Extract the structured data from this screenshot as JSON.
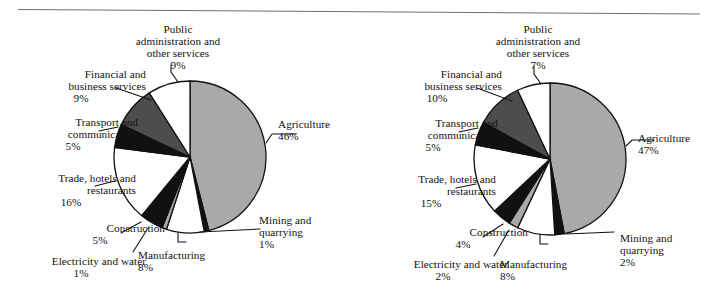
{
  "figure": {
    "name": "sectoral-composition-pies",
    "panel_count": 2,
    "divider": "top-horizontal-rule"
  },
  "colors": {
    "agriculture": "#a9a9a9",
    "mining": "#111111",
    "manufacturing": "#ffffff",
    "electricity": "#a9a9a9",
    "construction": "#111111",
    "trade": "#ffffff",
    "transport": "#111111",
    "financial": "#4d4d4d",
    "public_admin": "#ffffff",
    "outline": "#111111",
    "text": "#111111",
    "rule": "#6f6f6f",
    "background": "#ffffff"
  },
  "chart_data": [
    {
      "type": "pie",
      "name": "left-pie",
      "title": "",
      "legend_position": "callout-labels",
      "start_angle_deg": 0,
      "direction": "clockwise",
      "center": {
        "x": 190,
        "y": 157
      },
      "radius": 76,
      "categories": [
        "Agriculture",
        "Mining and quarrying",
        "Manufacturing",
        "Electricity and water",
        "Construction",
        "Trade, hotels and restaurants",
        "Transport and communication",
        "Financial and business services",
        "Public administration and other services"
      ],
      "values": [
        46,
        1,
        8,
        1,
        5,
        16,
        5,
        9,
        9
      ],
      "value_labels": [
        "46%",
        "1%",
        "8%",
        "1%",
        "5%",
        "16%",
        "5%",
        "9%",
        "9%"
      ],
      "slices": [
        {
          "label": "Agriculture",
          "pct": 46,
          "pct_text": "46%",
          "fill": "#a9a9a9",
          "label_lines": [
            "Agriculture"
          ],
          "label_x": 278,
          "label_y": 118,
          "align": "left",
          "leader": "M 266,143 L 272,134 L 296,134"
        },
        {
          "label": "Mining and quarrying",
          "pct": 1,
          "pct_text": "1%",
          "fill": "#111111",
          "label_lines": [
            "Mining and",
            "quarrying"
          ],
          "label_x": 259,
          "label_y": 214,
          "align": "left",
          "leader": "M 200,232 L 260,229"
        },
        {
          "label": "Manufacturing",
          "pct": 8,
          "pct_text": "8%",
          "fill": "#ffffff",
          "label_lines": [
            "Manufacturing"
          ],
          "label_x": 138,
          "label_y": 249,
          "align": "left",
          "leader": "M 178,233 L 178,242 L 186,242"
        },
        {
          "label": "Electricity and water",
          "pct": 1,
          "pct_text": "1%",
          "fill": "#a9a9a9",
          "label_lines": [
            "Electricity and water"
          ],
          "label_x": 16,
          "label_y": 255,
          "align": "right",
          "leader": "M 148,228 L 133,252"
        },
        {
          "label": "Construction",
          "pct": 5,
          "pct_text": "5%",
          "fill": "#111111",
          "label_lines": [
            "Construction"
          ],
          "label_x": 35,
          "label_y": 222,
          "align": "right",
          "leader": "M 141,222 L 121,233"
        },
        {
          "label": "Trade, hotels and restaurants",
          "pct": 16,
          "pct_text": "16%",
          "fill": "#ffffff",
          "label_lines": [
            "Trade, hotels and",
            "restaurants"
          ],
          "label_x": 6,
          "label_y": 172,
          "align": "right",
          "leader": "M 115,181 L 95,186"
        },
        {
          "label": "Transport and communication",
          "pct": 5,
          "pct_text": "5%",
          "fill": "#111111",
          "label_lines": [
            "Transport and",
            "communication"
          ],
          "label_x": 8,
          "label_y": 116,
          "align": "right",
          "leader": "M 118,127 L 99,131"
        },
        {
          "label": "Financial and business services",
          "pct": 9,
          "pct_text": "9%",
          "fill": "#4d4d4d",
          "label_lines": [
            "Financial and",
            "business services"
          ],
          "label_x": 16,
          "label_y": 68,
          "align": "right",
          "leader": "M 151,100 L 116,88"
        },
        {
          "label": "Public administration and other services",
          "pct": 9,
          "pct_text": "9%",
          "fill": "#ffffff",
          "label_lines": [
            "Public",
            "administration and",
            "other services"
          ],
          "label_x": 110,
          "label_y": 23,
          "align": "center",
          "leader": "M 178,82 L 171,72 L 171,65"
        }
      ]
    },
    {
      "type": "pie",
      "name": "right-pie",
      "title": "",
      "legend_position": "callout-labels",
      "start_angle_deg": 0,
      "direction": "clockwise",
      "center": {
        "x": 550,
        "y": 159
      },
      "radius": 76,
      "categories": [
        "Agriculture",
        "Mining and quarrying",
        "Manufacturing",
        "Electricity and water",
        "Construction",
        "Trade, hotels and restaurants",
        "Transport and communication",
        "Financial and business services",
        "Public administration and other services"
      ],
      "values": [
        47,
        2,
        8,
        2,
        4,
        15,
        5,
        10,
        7
      ],
      "value_labels": [
        "47%",
        "2%",
        "8%",
        "2%",
        "4%",
        "15%",
        "5%",
        "10%",
        "7%"
      ],
      "slices": [
        {
          "label": "Agriculture",
          "pct": 47,
          "pct_text": "47%",
          "fill": "#a9a9a9",
          "label_lines": [
            "Agriculture"
          ],
          "label_x": 638,
          "label_y": 132,
          "align": "left",
          "leader": "M 626,146 L 632,140 L 654,140"
        },
        {
          "label": "Mining and quarrying",
          "pct": 2,
          "pct_text": "2%",
          "fill": "#111111",
          "label_lines": [
            "Mining and",
            "quarrying"
          ],
          "label_x": 620,
          "label_y": 232,
          "align": "left",
          "leader": "M 566,234 L 614,232"
        },
        {
          "label": "Manufacturing",
          "pct": 8,
          "pct_text": "8%",
          "fill": "#ffffff",
          "label_lines": [
            "Manufacturing"
          ],
          "label_x": 500,
          "label_y": 258,
          "align": "left",
          "leader": "M 540,234 L 540,244 L 548,244"
        },
        {
          "label": "Electricity and water",
          "pct": 2,
          "pct_text": "2%",
          "fill": "#a9a9a9",
          "label_lines": [
            "Electricity and water"
          ],
          "label_x": 378,
          "label_y": 258,
          "align": "right",
          "leader": "M 509,230 L 494,256"
        },
        {
          "label": "Construction",
          "pct": 4,
          "pct_text": "4%",
          "fill": "#111111",
          "label_lines": [
            "Construction"
          ],
          "label_x": 398,
          "label_y": 226,
          "align": "right",
          "leader": "M 503,224 L 483,237"
        },
        {
          "label": "Trade, hotels and restaurants",
          "pct": 15,
          "pct_text": "15%",
          "fill": "#ffffff",
          "label_lines": [
            "Trade, hotels and",
            "restaurants"
          ],
          "label_x": 366,
          "label_y": 173,
          "align": "right",
          "leader": "M 476,184 L 456,188"
        },
        {
          "label": "Transport and communication",
          "pct": 5,
          "pct_text": "5%",
          "fill": "#111111",
          "label_lines": [
            "Transport and",
            "communication"
          ],
          "label_x": 368,
          "label_y": 117,
          "align": "right",
          "leader": "M 478,128 L 459,132"
        },
        {
          "label": "Financial and business services",
          "pct": 10,
          "pct_text": "10%",
          "fill": "#4d4d4d",
          "label_lines": [
            "Financial and",
            "business services"
          ],
          "label_x": 372,
          "label_y": 68,
          "align": "right",
          "leader": "M 512,101 L 477,88"
        },
        {
          "label": "Public administration and other services",
          "pct": 7,
          "pct_text": "7%",
          "fill": "#ffffff",
          "label_lines": [
            "Public",
            "administration and",
            "other services"
          ],
          "label_x": 470,
          "label_y": 23,
          "align": "center",
          "leader": "M 541,84 L 534,74 L 534,66"
        }
      ]
    }
  ]
}
